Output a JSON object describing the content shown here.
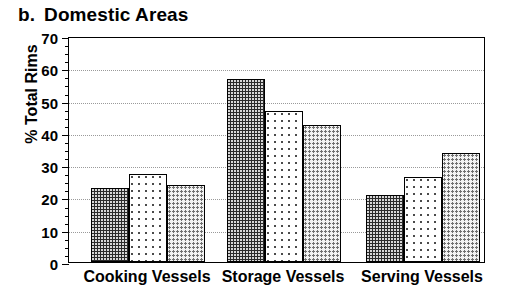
{
  "chart_data": {
    "type": "bar",
    "panel_label": "b.",
    "panel_title": "Domestic Areas",
    "xlabel": "",
    "ylabel": "% Total Rims",
    "ylim": [
      0,
      70
    ],
    "ytick_step": 10,
    "yticks": [
      0,
      10,
      20,
      30,
      40,
      50,
      60,
      70
    ],
    "ytick_labels": [
      "0",
      "10",
      "20",
      "30",
      "40",
      "50",
      "60",
      "70"
    ],
    "minor_tick_step": 2.5,
    "grid": "horizontal-dotted",
    "legend": "none",
    "categories": [
      "Cooking Vessels",
      "Storage Vessels",
      "Serving Vessels"
    ],
    "series": [
      {
        "name": "Series 1",
        "pattern": "dark-dense-dots",
        "values": [
          22.8,
          56.7,
          20.8
        ]
      },
      {
        "name": "Series 2",
        "pattern": "white-sparse-dots",
        "values": [
          27.3,
          46.8,
          26.3
        ]
      },
      {
        "name": "Series 3",
        "pattern": "grey-dots",
        "values": [
          24.0,
          42.4,
          33.8
        ]
      }
    ],
    "colors": {
      "series1_fill": "#2b2b2b",
      "series2_fill": "#ffffff",
      "series3_fill": "#f2f2f2",
      "axis": "#000000",
      "gridline": "#9a9a9a",
      "background": "#ffffff"
    }
  }
}
